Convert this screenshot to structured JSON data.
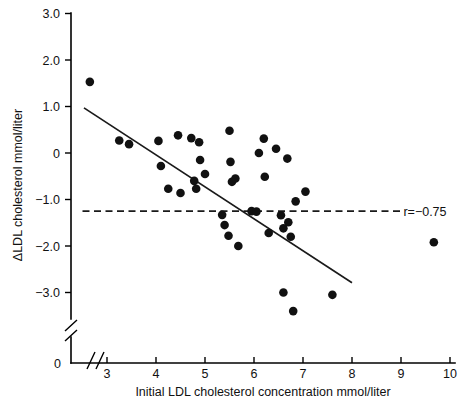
{
  "chart_data": {
    "type": "scatter",
    "title": "",
    "xlabel": "Initial LDL cholesterol concentration mmol/liter",
    "ylabel": "ΔLDL cholesterol mmol/liter",
    "xlim": [
      2.4,
      10.2
    ],
    "ylim": [
      -3.6,
      3.0
    ],
    "grid": false,
    "legend": null,
    "x_ticks": [
      "3",
      "4",
      "5",
      "6",
      "7",
      "8",
      "9",
      "10"
    ],
    "x_tick_values": [
      3,
      4,
      5,
      6,
      7,
      8,
      9,
      10
    ],
    "y_ticks": [
      "3.0",
      "2.0",
      "1.0",
      "0",
      "−1.0",
      "−2.0",
      "−3.0"
    ],
    "y_tick_values": [
      3.0,
      2.0,
      1.0,
      0,
      -1.0,
      -2.0,
      -3.0
    ],
    "y_origin_tick_label": "0",
    "axis_break": true,
    "annotations": [
      {
        "name": "correlation",
        "text": "r=−0.75",
        "x": 9.05,
        "y": -1.25
      }
    ],
    "reference_line": {
      "name": "mean-change-line",
      "style": "dashed",
      "y": -1.25,
      "x_start": 2.5,
      "x_end": 9.0
    },
    "fit_line": {
      "name": "regression-line",
      "style": "solid",
      "x_start": 2.53,
      "y_start": 0.97,
      "x_end": 8.0,
      "y_end": -2.79,
      "slope": -0.687,
      "intercept": 2.708
    },
    "series": [
      {
        "name": "patients",
        "marker": "filled-circle",
        "color": "#111111",
        "points": [
          {
            "x": 2.65,
            "y": 1.53
          },
          {
            "x": 3.25,
            "y": 0.27
          },
          {
            "x": 3.45,
            "y": 0.19
          },
          {
            "x": 4.05,
            "y": 0.26
          },
          {
            "x": 4.1,
            "y": -0.28
          },
          {
            "x": 4.25,
            "y": -0.77
          },
          {
            "x": 4.45,
            "y": 0.38
          },
          {
            "x": 4.5,
            "y": -0.86
          },
          {
            "x": 4.72,
            "y": 0.32
          },
          {
            "x": 4.78,
            "y": -0.6
          },
          {
            "x": 4.82,
            "y": -0.77
          },
          {
            "x": 4.88,
            "y": 0.23
          },
          {
            "x": 4.9,
            "y": -0.15
          },
          {
            "x": 5.0,
            "y": -0.45
          },
          {
            "x": 5.35,
            "y": -1.33
          },
          {
            "x": 5.4,
            "y": -1.55
          },
          {
            "x": 5.48,
            "y": -1.78
          },
          {
            "x": 5.5,
            "y": 0.48
          },
          {
            "x": 5.52,
            "y": -0.19
          },
          {
            "x": 5.55,
            "y": -0.62
          },
          {
            "x": 5.62,
            "y": -0.55
          },
          {
            "x": 5.68,
            "y": -2.0
          },
          {
            "x": 5.95,
            "y": -1.25
          },
          {
            "x": 6.05,
            "y": -1.26
          },
          {
            "x": 6.1,
            "y": 0.0
          },
          {
            "x": 6.2,
            "y": 0.31
          },
          {
            "x": 6.22,
            "y": -0.51
          },
          {
            "x": 6.3,
            "y": -1.72
          },
          {
            "x": 6.45,
            "y": 0.09
          },
          {
            "x": 6.55,
            "y": -1.34
          },
          {
            "x": 6.6,
            "y": -1.62
          },
          {
            "x": 6.6,
            "y": -3.0
          },
          {
            "x": 6.68,
            "y": -0.12
          },
          {
            "x": 6.7,
            "y": -1.49
          },
          {
            "x": 6.75,
            "y": -1.8
          },
          {
            "x": 6.8,
            "y": -3.4
          },
          {
            "x": 6.85,
            "y": -1.04
          },
          {
            "x": 7.05,
            "y": -0.83
          },
          {
            "x": 7.6,
            "y": -3.05
          },
          {
            "x": 9.67,
            "y": -1.92
          }
        ]
      }
    ]
  }
}
